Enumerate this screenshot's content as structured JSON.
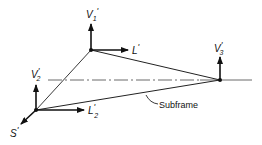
{
  "diagram": {
    "colors": {
      "ink": "#111111",
      "background": "#ffffff"
    },
    "nodes": {
      "top": {
        "x": 91,
        "y": 50
      },
      "right": {
        "x": 220,
        "y": 80
      },
      "bottom_left": {
        "x": 36,
        "y": 110
      }
    },
    "labels": {
      "v1": {
        "main": "V",
        "sub": "1",
        "prime": "'"
      },
      "l": {
        "main": "L",
        "sub": "",
        "prime": "'"
      },
      "v3": {
        "main": "V",
        "sub": "3",
        "prime": "'"
      },
      "v2": {
        "main": "V",
        "sub": "2",
        "prime": "'"
      },
      "l2": {
        "main": "L",
        "sub": "2",
        "prime": "'"
      },
      "s": {
        "main": "S",
        "sub": "",
        "prime": "'"
      },
      "subframe": "Subframe"
    }
  }
}
